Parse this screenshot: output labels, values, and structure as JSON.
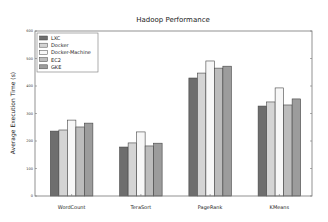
{
  "chart_data": {
    "type": "bar",
    "title": "Hadoop Performance",
    "xlabel": "",
    "ylabel": "Average Execution Time (s)",
    "ylim": [
      0,
      600
    ],
    "yticks": [
      0,
      100,
      200,
      300,
      400,
      500,
      600
    ],
    "grid": false,
    "legend_position": "upper left",
    "categories": [
      "WordCount",
      "TeraSort",
      "PageRank",
      "KMeans"
    ],
    "series": [
      {
        "name": "LXC",
        "color": "#6e6e6e",
        "values": [
          236,
          178,
          429,
          327
        ]
      },
      {
        "name": "Docker",
        "color": "#d4d4d4",
        "values": [
          240,
          193,
          447,
          342
        ]
      },
      {
        "name": "Docker-Machine",
        "color": "#f7f7f7",
        "values": [
          276,
          233,
          491,
          393
        ]
      },
      {
        "name": "EC2",
        "color": "#bcbcbc",
        "values": [
          251,
          182,
          465,
          331
        ]
      },
      {
        "name": "GKE",
        "color": "#9c9c9c",
        "values": [
          265,
          192,
          472,
          353
        ]
      }
    ]
  }
}
